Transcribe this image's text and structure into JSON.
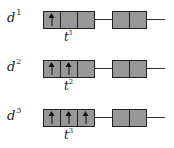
{
  "diagram": {
    "rows": [
      {
        "label": "d",
        "label_sup": "1",
        "t_label": "t",
        "t_sup": "1",
        "cells_filled": [
          true,
          false,
          false
        ],
        "trailing_cells": 2
      },
      {
        "label": "d",
        "label_sup": "2",
        "t_label": "t",
        "t_sup": "2",
        "cells_filled": [
          true,
          true,
          false
        ],
        "trailing_cells": 2
      },
      {
        "label": "d",
        "label_sup": "3",
        "t_label": "t",
        "t_sup": "3",
        "cells_filled": [
          true,
          true,
          true
        ],
        "trailing_cells": 2
      }
    ],
    "colors": {
      "cell_fill": "#979797",
      "border": "#222222",
      "line": "#333333"
    }
  }
}
